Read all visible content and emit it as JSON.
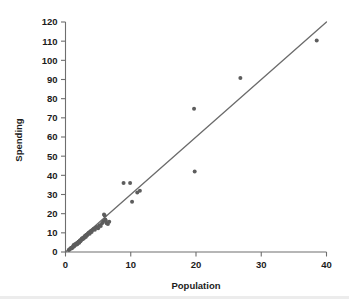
{
  "chart_data": {
    "type": "scatter",
    "title": "",
    "subtitle": "",
    "xlabel": "Population",
    "ylabel": "Spending",
    "xlim": [
      0,
      40
    ],
    "ylim": [
      0,
      120
    ],
    "xticks": [
      0,
      10,
      20,
      30,
      40
    ],
    "yticks": [
      0,
      10,
      20,
      30,
      40,
      50,
      60,
      70,
      80,
      90,
      100,
      110,
      120
    ],
    "xtick_labels": [
      "0",
      "10",
      "20",
      "30",
      "40"
    ],
    "ytick_labels": [
      "0",
      "10",
      "20",
      "30",
      "40",
      "50",
      "60",
      "70",
      "80",
      "90",
      "100",
      "110",
      "120"
    ],
    "grid": false,
    "legend": null,
    "point_color": "#5d5d5d",
    "line_color": "#6b6b6b",
    "axis_color": "#6e6e6e",
    "marker_size": 2.0,
    "annotations": [],
    "trendline": {
      "type": "linear",
      "x": [
        0,
        40
      ],
      "y": [
        0,
        120
      ],
      "slope": 3.0,
      "intercept": 0.0
    },
    "points": [
      [
        0.5,
        1.0
      ],
      [
        0.6,
        1.3
      ],
      [
        0.7,
        1.6
      ],
      [
        0.8,
        1.9
      ],
      [
        0.9,
        2.2
      ],
      [
        1.0,
        2.0
      ],
      [
        1.1,
        2.6
      ],
      [
        1.2,
        3.0
      ],
      [
        1.25,
        3.6
      ],
      [
        1.3,
        2.9
      ],
      [
        1.4,
        3.4
      ],
      [
        1.5,
        4.2
      ],
      [
        1.6,
        3.8
      ],
      [
        1.7,
        4.6
      ],
      [
        1.8,
        4.1
      ],
      [
        1.9,
        5.0
      ],
      [
        2.0,
        5.4
      ],
      [
        2.1,
        4.8
      ],
      [
        2.2,
        6.0
      ],
      [
        2.3,
        5.6
      ],
      [
        2.4,
        6.4
      ],
      [
        2.5,
        7.0
      ],
      [
        2.6,
        6.6
      ],
      [
        2.7,
        7.5
      ],
      [
        2.8,
        7.1
      ],
      [
        2.9,
        8.0
      ],
      [
        3.0,
        8.5
      ],
      [
        3.1,
        7.8
      ],
      [
        3.2,
        9.0
      ],
      [
        3.3,
        8.6
      ],
      [
        3.4,
        9.4
      ],
      [
        3.5,
        9.8
      ],
      [
        3.6,
        10.2
      ],
      [
        3.7,
        9.5
      ],
      [
        3.8,
        10.6
      ],
      [
        3.9,
        11.0
      ],
      [
        4.0,
        10.4
      ],
      [
        4.1,
        11.4
      ],
      [
        4.3,
        12.0
      ],
      [
        4.5,
        11.6
      ],
      [
        4.6,
        12.6
      ],
      [
        4.8,
        13.0
      ],
      [
        5.0,
        12.4
      ],
      [
        5.2,
        14.0
      ],
      [
        5.4,
        13.6
      ],
      [
        5.6,
        15.0
      ],
      [
        5.8,
        16.0
      ],
      [
        5.9,
        19.6
      ],
      [
        6.0,
        19.0
      ],
      [
        6.1,
        17.0
      ],
      [
        6.2,
        16.2
      ],
      [
        6.3,
        15.0
      ],
      [
        6.5,
        14.6
      ],
      [
        6.7,
        15.8
      ],
      [
        8.9,
        36.0
      ],
      [
        9.9,
        36.0
      ],
      [
        10.2,
        26.2
      ],
      [
        11.0,
        31.0
      ],
      [
        11.4,
        32.0
      ],
      [
        19.7,
        74.8
      ],
      [
        19.8,
        42.0
      ],
      [
        26.8,
        90.8
      ],
      [
        38.5,
        110.4
      ]
    ]
  }
}
